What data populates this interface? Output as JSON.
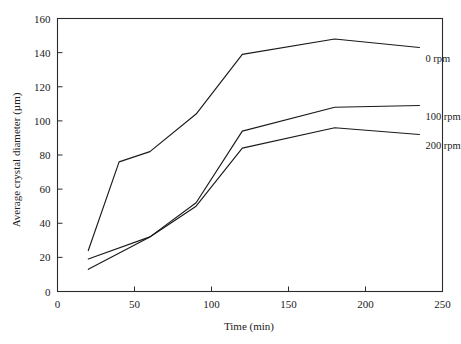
{
  "chart_data": {
    "type": "line",
    "title": "",
    "xlabel": "Time (min)",
    "ylabel": "Average crystal diameter (µm)",
    "xlim": [
      0,
      250
    ],
    "ylim": [
      0,
      160
    ],
    "xticks": [
      0,
      50,
      100,
      150,
      200,
      250
    ],
    "yticks": [
      0,
      20,
      40,
      60,
      80,
      100,
      120,
      140,
      160
    ],
    "grid": false,
    "legend_position": "inline-right-of-curves",
    "series": [
      {
        "name": "0 rpm",
        "x": [
          20,
          40,
          60,
          90,
          120,
          180,
          235
        ],
        "values": [
          24,
          76,
          82,
          104,
          139,
          148,
          143
        ]
      },
      {
        "name": "100 rpm",
        "x": [
          20,
          60,
          90,
          120,
          180,
          235
        ],
        "values": [
          19,
          32,
          52,
          94,
          108,
          109
        ]
      },
      {
        "name": "200 rpm",
        "x": [
          20,
          60,
          90,
          120,
          180,
          235
        ],
        "values": [
          13,
          32,
          50,
          84,
          96,
          92
        ]
      }
    ]
  },
  "axis": {
    "x_tick_labels": [
      "0",
      "50",
      "100",
      "150",
      "200",
      "250"
    ],
    "y_tick_labels": [
      "0",
      "20",
      "40",
      "60",
      "80",
      "100",
      "120",
      "140",
      "160"
    ],
    "x_title": "Time (min)",
    "y_title": "Average crystal diameter (µm)"
  },
  "series_labels": [
    {
      "text": "0 rpm",
      "series": "0 rpm"
    },
    {
      "text": "100 rpm",
      "series": "100 rpm"
    },
    {
      "text": "200 rpm",
      "series": "200 rpm"
    }
  ],
  "colors": {
    "line": "#1a1a1a",
    "axis": "#2b2b2b",
    "background": "#ffffff"
  }
}
